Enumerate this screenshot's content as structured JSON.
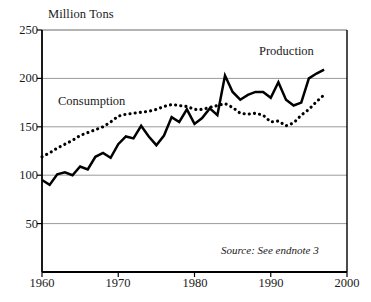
{
  "chart_data": {
    "type": "line",
    "title": "Million Tons",
    "xlabel": "",
    "ylabel": "Million Tons",
    "xlim": [
      1960,
      2000
    ],
    "ylim": [
      0,
      250
    ],
    "yticks": [
      50,
      100,
      150,
      200,
      250
    ],
    "xticks": [
      1960,
      1970,
      1980,
      1990,
      2000
    ],
    "grid": true,
    "legend_position": "inline-annotations",
    "annotations": [
      "Production",
      "Consumption",
      "Source: See endnote 3"
    ],
    "source_note": "Source: See endnote 3",
    "x": [
      1960,
      1961,
      1962,
      1963,
      1964,
      1965,
      1966,
      1967,
      1968,
      1969,
      1970,
      1971,
      1972,
      1973,
      1974,
      1975,
      1976,
      1977,
      1978,
      1979,
      1980,
      1981,
      1982,
      1983,
      1984,
      1985,
      1986,
      1987,
      1988,
      1989,
      1990,
      1991,
      1992,
      1993,
      1994,
      1995,
      1996,
      1997
    ],
    "series": [
      {
        "name": "Production",
        "style": "solid",
        "color": "#000000",
        "values": [
          95,
          90,
          101,
          103,
          100,
          109,
          106,
          119,
          123,
          118,
          132,
          140,
          138,
          151,
          140,
          131,
          141,
          160,
          155,
          168,
          153,
          159,
          169,
          162,
          203,
          186,
          178,
          183,
          186,
          186,
          180,
          196,
          178,
          172,
          175,
          200,
          205,
          209
        ]
      },
      {
        "name": "Consumption",
        "style": "dotted",
        "color": "#000000",
        "values": [
          119,
          123,
          128,
          132,
          136,
          141,
          144,
          147,
          150,
          155,
          161,
          163,
          164,
          165,
          166,
          168,
          171,
          173,
          172,
          171,
          168,
          168,
          170,
          172,
          174,
          170,
          164,
          163,
          164,
          162,
          155,
          156,
          151,
          154,
          162,
          168,
          176,
          183
        ]
      }
    ]
  },
  "axes": {
    "title": "Million Tons",
    "y_tick_labels": [
      "250",
      "200",
      "150",
      "100",
      "50"
    ],
    "x_tick_labels": [
      "1960",
      "1970",
      "1980",
      "1990",
      "2000"
    ]
  },
  "labels": {
    "production": "Production",
    "consumption": "Consumption",
    "source": "Source: See endnote 3"
  }
}
